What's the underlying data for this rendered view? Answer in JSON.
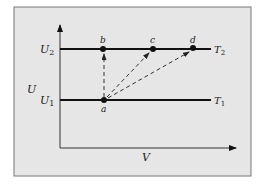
{
  "colors": {
    "panel_bg": "#e6e6e6",
    "panel_border": "#777777",
    "line": "#111111",
    "dashed": "#333333"
  },
  "axes": {
    "y_label": "U",
    "x_label": "V"
  },
  "levels": [
    {
      "id": "U2",
      "label_left": "U",
      "label_left_sub": "2",
      "label_right": "T",
      "label_right_sub": "2"
    },
    {
      "id": "U1",
      "label_left": "U",
      "label_left_sub": "1",
      "label_right": "T",
      "label_right_sub": "1"
    }
  ],
  "points": [
    {
      "id": "a",
      "label": "a"
    },
    {
      "id": "b",
      "label": "b"
    },
    {
      "id": "c",
      "label": "c"
    },
    {
      "id": "d",
      "label": "d"
    }
  ],
  "paths": [
    {
      "from": "a",
      "to": "b",
      "style": "dashed"
    },
    {
      "from": "a",
      "to": "c",
      "style": "dashed"
    },
    {
      "from": "a",
      "to": "d",
      "style": "dashed"
    }
  ]
}
